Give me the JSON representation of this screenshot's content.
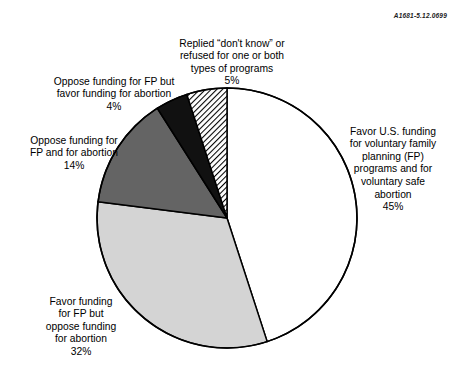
{
  "figure": {
    "reference_code": "A1681-5.12.0699",
    "background_color": "#ffffff"
  },
  "chart_data": {
    "type": "pie",
    "title": "",
    "subtitle": "",
    "xlabel": "",
    "ylabel": "",
    "legend_position": "callout-labels",
    "grid": false,
    "total": 100,
    "units": "%",
    "start_angle_deg": 0,
    "direction": "clockwise",
    "categories": [
      "Favor U.S. funding for voluntary family planning (FP) programs and for voluntary safe abortion",
      "Favor funding for FP but oppose funding for abortion",
      "Oppose funding for FP and for abortion",
      "Oppose funding for FP but favor funding for abortion",
      "Replied “don't know” or refused for one or both types of programs"
    ],
    "values": [
      45,
      32,
      14,
      4,
      5
    ],
    "slices": [
      {
        "label": "Favor U.S. funding\nfor voluntary family\nplanning (FP)\nprograms and for\nvoluntary safe\nabortion",
        "value": 45,
        "value_text": "45%",
        "fill": "#ffffff",
        "pattern": "solid",
        "stroke": "#000000",
        "start_deg": 0,
        "end_deg": 162
      },
      {
        "label": "Favor funding\nfor FP but\noppose funding\nfor abortion",
        "value": 32,
        "value_text": "32%",
        "fill": "#d4d4d4",
        "pattern": "solid",
        "stroke": "#000000",
        "start_deg": 162,
        "end_deg": 277.2
      },
      {
        "label": "Oppose funding for\nFP and for abortion",
        "value": 14,
        "value_text": "14%",
        "fill": "#646464",
        "pattern": "solid",
        "stroke": "#000000",
        "start_deg": 277.2,
        "end_deg": 327.6
      },
      {
        "label": "Oppose funding for FP but\nfavor funding for abortion",
        "value": 4,
        "value_text": "4%",
        "fill": "#111111",
        "pattern": "solid",
        "stroke": "#000000",
        "start_deg": 327.6,
        "end_deg": 342
      },
      {
        "label": "Replied “don't know” or\nrefused for one or both\ntypes of programs",
        "value": 5,
        "value_text": "5%",
        "fill": "#ffffff",
        "pattern": "diagonal-hatch",
        "stroke": "#000000",
        "start_deg": 342,
        "end_deg": 360
      }
    ],
    "geometry": {
      "center_x": 227,
      "center_y": 218,
      "radius": 130
    }
  }
}
